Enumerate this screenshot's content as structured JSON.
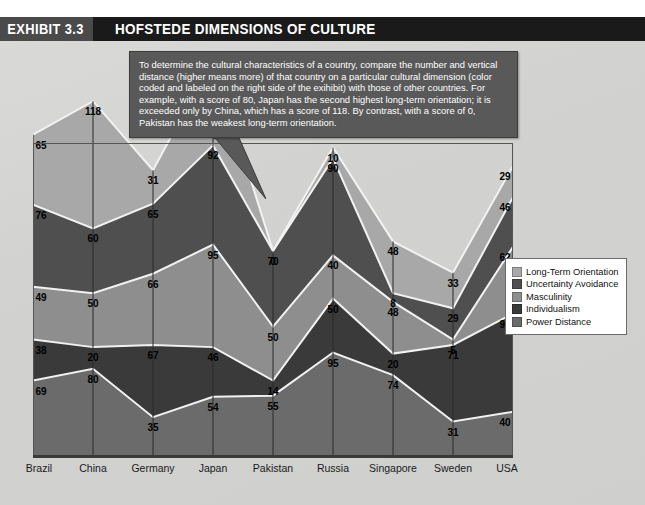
{
  "header": {
    "exhibit_tag": "EXHIBIT 3.3",
    "title": "HOFSTEDE DIMENSIONS OF CULTURE"
  },
  "callout": {
    "text": "To determine the cultural characteristics of a country, compare the number and vertical distance (higher means more) of that country on a particular cultural dimension (color coded and labeled on the right side of the exihibit) with those of other countries.  For example, with a score of 80, Japan has the second highest long-term orientation; it is exceeded only by China, which has a score of 118.  By contrast, with a score of 0, Pakistan has the weakest long-term orientation."
  },
  "legend": {
    "items": [
      {
        "label": "Long-Term Orientation",
        "color": "#a8a8a8"
      },
      {
        "label": "Uncertainty Avoidance",
        "color": "#4f4f4f"
      },
      {
        "label": "Masculinity",
        "color": "#8e8e8e"
      },
      {
        "label": "Individualism",
        "color": "#3a3a3a"
      },
      {
        "label": "Power Distance",
        "color": "#6b6b6b"
      }
    ]
  },
  "chart_data": {
    "type": "area",
    "title": "HOFSTEDE DIMENSIONS OF CULTURE",
    "xlabel": "",
    "ylabel": "",
    "grid": false,
    "legend_position": "right",
    "stacked": true,
    "categories": [
      "Brazil",
      "China",
      "Germany",
      "Japan",
      "Pakistan",
      "Russia",
      "Singapore",
      "Sweden",
      "USA"
    ],
    "series": [
      {
        "name": "Power Distance",
        "color": "#6b6b6b",
        "values": [
          69,
          80,
          35,
          54,
          55,
          95,
          74,
          31,
          40
        ]
      },
      {
        "name": "Individualism",
        "color": "#3a3a3a",
        "values": [
          38,
          20,
          67,
          46,
          14,
          50,
          20,
          71,
          91
        ]
      },
      {
        "name": "Masculinity",
        "color": "#8e8e8e",
        "values": [
          49,
          50,
          66,
          95,
          50,
          40,
          48,
          5,
          62
        ]
      },
      {
        "name": "Uncertainty Avoidance",
        "color": "#4f4f4f",
        "values": [
          76,
          60,
          65,
          92,
          70,
          90,
          8,
          29,
          46
        ]
      },
      {
        "name": "Long-Term Orientation",
        "color": "#a8a8a8",
        "values": [
          65,
          118,
          31,
          80,
          0,
          10,
          48,
          33,
          29
        ]
      }
    ],
    "ylim": [
      0,
      330
    ]
  }
}
